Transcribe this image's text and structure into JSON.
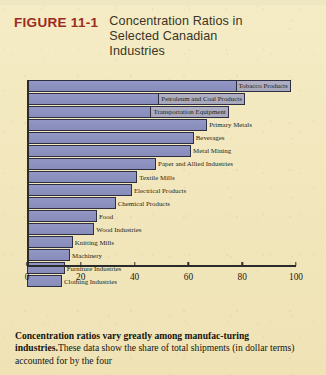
{
  "figure": {
    "number_label": "FIGURE 11-1",
    "title_lines": [
      "Concentration Ratios in",
      "Selected Canadian",
      "Industries"
    ],
    "accent_color": "#9d2a20",
    "page_color": "#f2e8c0",
    "bar_color": "#8f93bf"
  },
  "caption": {
    "lead": "Concentration ratios vary greatly among manufac-turing industries.",
    "body": "These data show the share of total shipments (in dollar terms) accounted for by the four"
  },
  "chart_data": {
    "type": "bar",
    "orientation": "horizontal",
    "title": "Concentration Ratios in Selected Canadian Industries",
    "xlabel": "",
    "ylabel": "",
    "xlim": [
      0,
      100
    ],
    "grid": false,
    "legend": false,
    "tick_labels": [
      "0",
      "20",
      "40",
      "60",
      "80",
      "100"
    ],
    "ticks": [
      0,
      20,
      40,
      60,
      80,
      100
    ],
    "categories": [
      "Tobacco Products",
      "Petroleum and Coal Products",
      "Transportation Equipment",
      "Primary Metals",
      "Beverages",
      "Metal Mining",
      "Paper and Allied Industries",
      "Textile Mills",
      "Electrical Products",
      "Chemical Products",
      "Food",
      "Wood Industries",
      "Knitting Mills",
      "Machinery",
      "Furniture Industries",
      "Clothing Industries"
    ],
    "values": [
      98,
      81,
      75,
      67,
      62,
      61,
      48,
      41,
      39,
      33,
      26,
      25,
      17,
      16,
      14,
      13
    ],
    "label_inside": [
      true,
      true,
      true,
      false,
      false,
      false,
      false,
      false,
      false,
      false,
      false,
      false,
      false,
      false,
      false,
      false
    ]
  }
}
